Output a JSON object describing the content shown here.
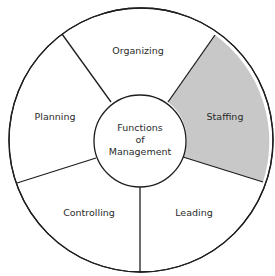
{
  "diagram": {
    "title": "Functions of Management",
    "center": {
      "lines": [
        "Functions",
        "of",
        "Management"
      ]
    },
    "segments": [
      {
        "id": "organizing",
        "label": "Organizing",
        "highlighted": false
      },
      {
        "id": "staffing",
        "label": "Staffing",
        "highlighted": true
      },
      {
        "id": "leading",
        "label": "Leading",
        "highlighted": false
      },
      {
        "id": "controlling",
        "label": "Controlling",
        "highlighted": false
      },
      {
        "id": "planning",
        "label": "Planning",
        "highlighted": false
      }
    ],
    "colors": {
      "highlight_fill": "#c8c8c8",
      "default_fill": "#ffffff",
      "stroke": "#1e1e1e",
      "text": "#2b2b2b"
    }
  }
}
